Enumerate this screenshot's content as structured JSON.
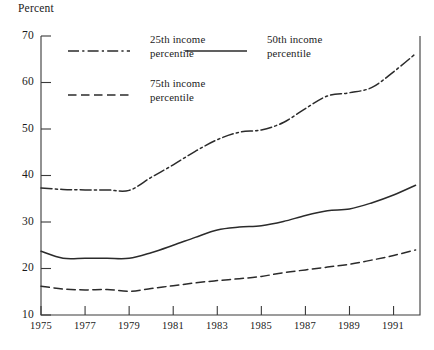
{
  "chart_data": {
    "type": "line",
    "title": "",
    "ylabel": "Percent",
    "xlabel": "",
    "ylim": [
      10,
      70
    ],
    "xlim": [
      1975,
      1992.2
    ],
    "grid": false,
    "legend_position": "top-inside",
    "ytick_labels": [
      "70",
      "60",
      "50",
      "40",
      "30",
      "20",
      "10"
    ],
    "ytick_values": [
      70,
      60,
      50,
      40,
      30,
      20,
      10
    ],
    "xtick_labels": [
      "1975",
      "1977",
      "1979",
      "1981",
      "1983",
      "1985",
      "1987",
      "1989",
      "1991"
    ],
    "xtick_values": [
      1975,
      1977,
      1979,
      1981,
      1983,
      1985,
      1987,
      1989,
      1991
    ],
    "x": [
      1975,
      1976,
      1977,
      1978,
      1979,
      1980,
      1981,
      1982,
      1983,
      1984,
      1985,
      1986,
      1987,
      1988,
      1989,
      1990,
      1991,
      1992
    ],
    "series": [
      {
        "name": "25th income percentile",
        "style": "dashdot",
        "color": "#2b2b2b",
        "values": [
          37.3,
          37.0,
          36.9,
          36.9,
          36.8,
          39.6,
          42.3,
          45.2,
          47.7,
          49.3,
          49.8,
          51.4,
          54.4,
          57.1,
          57.8,
          58.9,
          62.3,
          66.2
        ]
      },
      {
        "name": "50th income percentile",
        "style": "solid",
        "color": "#2b2b2b",
        "values": [
          23.7,
          22.2,
          22.2,
          22.2,
          22.2,
          23.4,
          25.0,
          26.7,
          28.3,
          28.9,
          29.2,
          30.1,
          31.4,
          32.4,
          32.8,
          34.1,
          35.8,
          37.9
        ]
      },
      {
        "name": "75th income percentile",
        "style": "dashed",
        "color": "#2b2b2b",
        "values": [
          16.2,
          15.6,
          15.4,
          15.5,
          15.1,
          15.7,
          16.3,
          16.9,
          17.4,
          17.8,
          18.3,
          19.1,
          19.7,
          20.3,
          20.9,
          21.8,
          22.8,
          24.0
        ]
      }
    ],
    "legend": [
      {
        "label_line1": "25th income",
        "label_line2": "percentile",
        "style": "dashdot"
      },
      {
        "label_line1": "50th income",
        "label_line2": "percentile",
        "style": "solid"
      },
      {
        "label_line1": "75th income",
        "label_line2": "percentile",
        "style": "dashed"
      }
    ]
  }
}
